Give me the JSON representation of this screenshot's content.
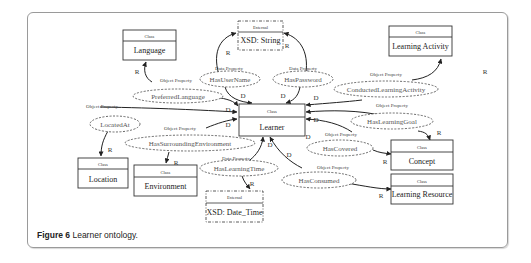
{
  "caption": {
    "label": "Figure 6",
    "text": " Learner ontology."
  },
  "classes": [
    {
      "id": "language",
      "stereotype": "Class",
      "name": "Language"
    },
    {
      "id": "learning-activity",
      "stereotype": "Class",
      "name": "Learning Activity"
    },
    {
      "id": "learner",
      "stereotype": "Class",
      "name": "Learner"
    },
    {
      "id": "location",
      "stereotype": "Class",
      "name": "Location"
    },
    {
      "id": "environment",
      "stereotype": "Class",
      "name": "Environment"
    },
    {
      "id": "concept",
      "stereotype": "Class",
      "name": "Concept"
    },
    {
      "id": "learning-resource",
      "stereotype": "Class",
      "name": "Learning Resource"
    }
  ],
  "externals": [
    {
      "id": "xsd-string",
      "stereotype": "External",
      "name": "XSD: String"
    },
    {
      "id": "xsd-datetime",
      "stereotype": "External",
      "name": "XSD: Date_Time"
    }
  ],
  "properties": [
    {
      "id": "has-user-name",
      "kind": "Data Property",
      "name": "HasUserName"
    },
    {
      "id": "has-password",
      "kind": "Data Property",
      "name": "HasPassword"
    },
    {
      "id": "preferred-language",
      "kind": "Object Property",
      "name": "PreferredLanguage"
    },
    {
      "id": "conducted-learning-activity",
      "kind": "Object Property",
      "name": "ConductedLearningActivity"
    },
    {
      "id": "located-at",
      "kind": "Object Property",
      "name": "LocatedAt"
    },
    {
      "id": "has-surrounding-environment",
      "kind": "Object Property",
      "name": "HasSurroundingEnvironment"
    },
    {
      "id": "has-learning-goal",
      "kind": "Object Property",
      "name": "HasLearningGoal"
    },
    {
      "id": "has-covered",
      "kind": "Object Property",
      "name": "HasCovered"
    },
    {
      "id": "has-learning-time",
      "kind": "Data Property",
      "name": "HasLearningTime"
    },
    {
      "id": "has-consumed",
      "kind": "Object Property",
      "name": "HasConsumed"
    }
  ],
  "edge_labels": {
    "domain": "D",
    "range": "R"
  }
}
